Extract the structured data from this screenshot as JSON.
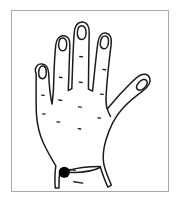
{
  "figure": {
    "description": "Line drawing of the dorsal view of a right hand with fingers spread and a single filled black dot marking an acupressure point near the wrist crease at the base of the hand.",
    "frame": {
      "border_color": "#a9a9a9",
      "background_color": "#ffffff",
      "x": 11,
      "y": 10,
      "width": 158,
      "height": 182
    },
    "drawing": {
      "line_color": "#1a1a1a",
      "fill_color": "#ffffff",
      "style": "ink line drawing"
    },
    "marker": {
      "name": "acupressure-point",
      "shape": "filled-circle",
      "color": "#000000",
      "x": 64,
      "y": 173,
      "radius": 5.6
    },
    "anatomy": {
      "view": "dorsal",
      "parts": [
        {
          "name": "little-finger",
          "label": "Little finger"
        },
        {
          "name": "ring-finger",
          "label": "Ring finger"
        },
        {
          "name": "middle-finger",
          "label": "Middle finger"
        },
        {
          "name": "index-finger",
          "label": "Index finger"
        },
        {
          "name": "thumb",
          "label": "Thumb"
        },
        {
          "name": "hand-dorsum",
          "label": "Back of hand"
        },
        {
          "name": "wrist",
          "label": "Wrist"
        }
      ],
      "fingernail_count": 5,
      "knuckle_marks_count": 12
    }
  }
}
